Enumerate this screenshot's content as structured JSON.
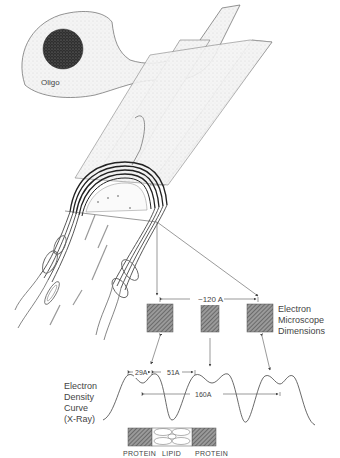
{
  "diagram": {
    "type": "myelin sheath structure schematic",
    "cell_label": "Oligo",
    "electron_microscope": {
      "label_lines": [
        "Electron",
        "Microscope",
        "Dimensions"
      ],
      "period_label": "~120 A",
      "boxes": 3
    },
    "electron_density": {
      "label_lines": [
        "Electron",
        "Density",
        "Curve",
        "(X-Ray)"
      ],
      "measurements": {
        "peak_pair": "29A",
        "gap": "51A",
        "period": "160A"
      }
    },
    "bilayer_labels": [
      "PROTEIN",
      "LIPID",
      "PROTEIN"
    ],
    "colors": {
      "line": "#555555",
      "hatch": "#666666",
      "stipple": "#eeeeee",
      "nucleus": "#3a3a3a"
    }
  }
}
